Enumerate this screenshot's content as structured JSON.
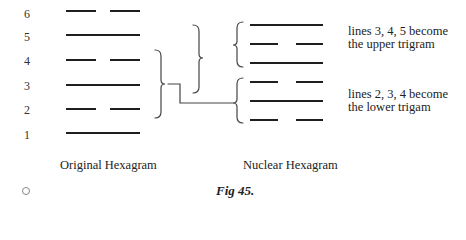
{
  "figure": {
    "caption": "Fig 45.",
    "original": {
      "label": "Original Hexagram",
      "line_numbers": [
        "6",
        "5",
        "4",
        "3",
        "2",
        "1"
      ],
      "lines_top_to_bottom": [
        "broken",
        "solid",
        "broken",
        "solid",
        "broken",
        "solid"
      ]
    },
    "nuclear": {
      "label": "Nuclear Hexagram",
      "lines_top_to_bottom": [
        "solid",
        "broken",
        "solid",
        "broken",
        "solid",
        "broken"
      ]
    },
    "annotations": {
      "upper_line1": "lines 3, 4, 5 become",
      "upper_line2": "the upper trigram",
      "lower_line1": "lines 2, 3, 4 become",
      "lower_line2": "the lower trigam"
    },
    "page_marker": "circle"
  }
}
